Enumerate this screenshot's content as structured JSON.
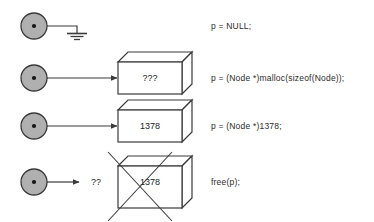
{
  "figure": {
    "background_color": "#ffffff",
    "stroke_color": "#3a3a3a",
    "circle_fill_color": "#b0b0b0",
    "text_color": "#2b2b2b"
  },
  "rows": [
    {
      "id": "row-null",
      "pointer_name": "pointer-node",
      "target_kind": "ground-symbol",
      "box_label": "",
      "arrow_label": "",
      "caption": "p = NULL;"
    },
    {
      "id": "row-malloc",
      "pointer_name": "pointer-node",
      "target_kind": "box",
      "box_label": "???",
      "arrow_label": "",
      "caption": "p = (Node *)malloc(sizeof(Node));"
    },
    {
      "id": "row-assign",
      "pointer_name": "pointer-node",
      "target_kind": "box",
      "box_label": "1378",
      "arrow_label": "",
      "caption": "p = (Node *)1378;"
    },
    {
      "id": "row-free",
      "pointer_name": "pointer-node",
      "target_kind": "box-crossed-out",
      "box_label": "1378",
      "arrow_label": "??",
      "caption": "free(p);"
    }
  ]
}
